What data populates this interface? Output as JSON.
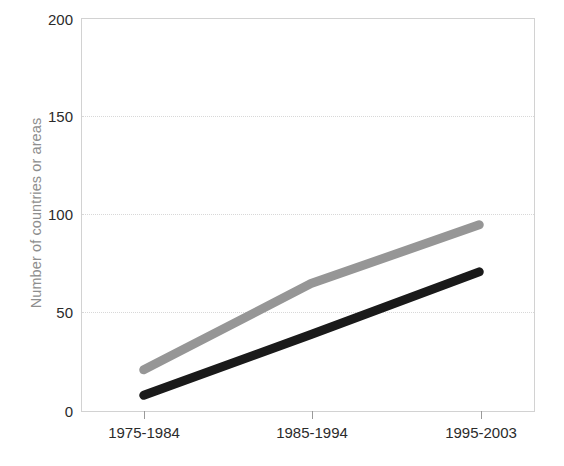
{
  "chart_data": {
    "type": "line",
    "title": "",
    "subtitle": "",
    "xlabel": "",
    "ylabel": "Number of countries or areas",
    "categories": [
      "1975-1984",
      "1985-1994",
      "1995-2003"
    ],
    "series": [
      {
        "name": "series-gray",
        "color": "#969696",
        "values": [
          21,
          65,
          95
        ]
      },
      {
        "name": "series-black",
        "color": "#1a1a1a",
        "values": [
          8,
          39,
          71
        ]
      }
    ],
    "ylim": [
      0,
      200
    ],
    "yticks": [
      0,
      50,
      100,
      150,
      200
    ],
    "ytick_labels": [
      "0",
      "50",
      "100",
      "150",
      "200"
    ],
    "gridlines_y": [
      50,
      100,
      150
    ],
    "grid": "horizontal-dotted",
    "legend": "none",
    "legend_position": "none",
    "annotations": []
  },
  "axis": {
    "y_title": "Number of countries or areas",
    "y_title_color": "#8e8e8e",
    "tick_label_color": "#2b2b2b",
    "frame_color": "#d2d2d2",
    "grid_color": "#d8d8d8"
  },
  "ytick_labels": {
    "t0": "0",
    "t1": "50",
    "t2": "100",
    "t3": "150",
    "t4": "200"
  },
  "xtick_labels": {
    "c0": "1975-1984",
    "c1": "1985-1994",
    "c2": "1995-2003"
  }
}
